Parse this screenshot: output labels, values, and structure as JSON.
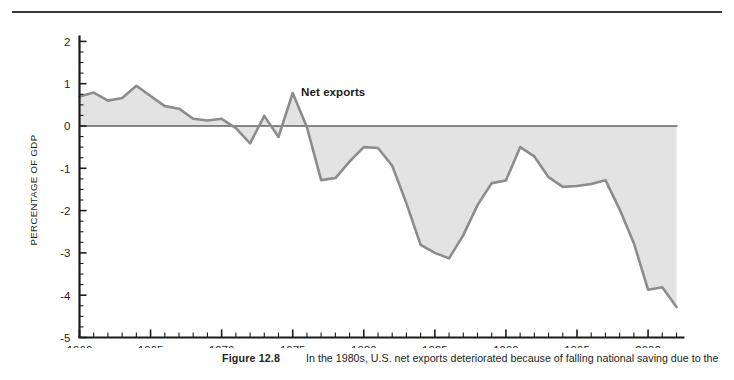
{
  "figure": {
    "caption_number": "Figure 12.8",
    "caption_text": "In the 1980s, U.S. net exports deteriorated because of falling national saving due to the",
    "series_label": "Net exports"
  },
  "chart_data": {
    "type": "area",
    "title": "",
    "subtitle": "",
    "xlabel": "",
    "ylabel": "PERCENTAGE OF GDP",
    "xlim": [
      1960,
      2002
    ],
    "ylim": [
      -5,
      2
    ],
    "grid": false,
    "legend_position": "inline-annotation",
    "annotations": [
      {
        "text": "Net exports",
        "x": 1976.5,
        "y": 0.9
      }
    ],
    "x_ticks_major": [
      1960,
      1965,
      1970,
      1975,
      1980,
      1985,
      1990,
      1995,
      2000
    ],
    "x_tick_labels": [
      "1960",
      "1965",
      "1970",
      "1975",
      "1980",
      "1985",
      "1990",
      "1995",
      "2000"
    ],
    "x_tick_minor_step": 1,
    "y_ticks_major": [
      2,
      1,
      0,
      -1,
      -2,
      -3,
      -4,
      -5
    ],
    "y_tick_labels": [
      "2",
      "1",
      "0",
      "-1",
      "-2",
      "-3",
      "-4",
      "-5"
    ],
    "y_tick_minor_step": 0.25,
    "series": [
      {
        "name": "Net exports",
        "line_color": "#8c8c8c",
        "fill_color": "#e3e3e3",
        "baseline": 0,
        "x": [
          1960,
          1961,
          1962,
          1963,
          1964,
          1965,
          1966,
          1967,
          1968,
          1969,
          1970,
          1971,
          1972,
          1973,
          1974,
          1975,
          1976,
          1977,
          1978,
          1979,
          1980,
          1981,
          1982,
          1983,
          1984,
          1985,
          1986,
          1987,
          1988,
          1989,
          1990,
          1991,
          1992,
          1993,
          1994,
          1995,
          1996,
          1997,
          1998,
          1999,
          2000,
          2001,
          2002
        ],
        "values": [
          0.7,
          0.79,
          0.6,
          0.66,
          0.95,
          0.71,
          0.47,
          0.41,
          0.17,
          0.13,
          0.17,
          -0.05,
          -0.41,
          0.24,
          -0.26,
          0.78,
          -0.03,
          -1.28,
          -1.23,
          -0.84,
          -0.5,
          -0.52,
          -0.94,
          -1.83,
          -2.81,
          -3.0,
          -3.13,
          -2.58,
          -1.87,
          -1.35,
          -1.29,
          -0.5,
          -0.72,
          -1.21,
          -1.44,
          -1.42,
          -1.37,
          -1.28,
          -1.97,
          -2.77,
          -3.87,
          -3.81,
          -4.28
        ]
      }
    ]
  },
  "colors": {
    "line": "#8c8c8c",
    "fill": "#e3e3e3",
    "axis": "#1b1b1b",
    "text": "#231f20"
  }
}
